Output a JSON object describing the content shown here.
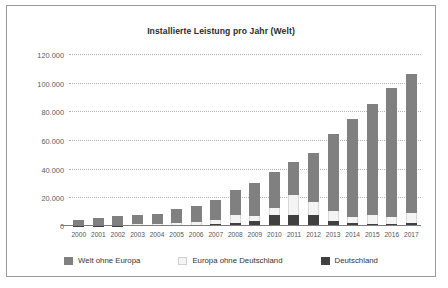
{
  "chart_data": {
    "type": "bar",
    "stacked": true,
    "title": "Installierte Leistung pro Jahr (Welt)",
    "xlabel": "",
    "ylabel": "",
    "ylim": [
      0,
      120000
    ],
    "ytick_values": [
      0,
      20000,
      40000,
      60000,
      80000,
      100000,
      120000
    ],
    "ytick_labels": [
      "0",
      "20.000",
      "40.000",
      "60.000",
      "80.000",
      "100.000",
      "120.000"
    ],
    "grid": true,
    "legend_position": "bottom",
    "categories": [
      "2000",
      "2001",
      "2002",
      "2003",
      "2004",
      "2005",
      "2006",
      "2007",
      "2008",
      "2009",
      "2010",
      "2011",
      "2012",
      "2013",
      "2014",
      "2015",
      "2016",
      "2017"
    ],
    "series": [
      {
        "name": "Deutschland",
        "color": "#404040",
        "values": [
          100,
          200,
          300,
          600,
          900,
          900,
          900,
          1100,
          1800,
          3800,
          7400,
          7500,
          7600,
          3300,
          1900,
          1500,
          1500,
          1800
        ]
      },
      {
        "name": "Europa ohne Deutschland",
        "color": "#f4f4f4",
        "values": [
          200,
          300,
          400,
          500,
          700,
          1500,
          1800,
          2900,
          5800,
          2900,
          5200,
          14000,
          9400,
          7200,
          4200,
          6000,
          4600,
          7200
        ]
      },
      {
        "name": "Welt ohne Europa",
        "color": "#808080",
        "values": [
          4000,
          5300,
          6300,
          6900,
          6800,
          9200,
          11100,
          14500,
          17400,
          23300,
          25400,
          23500,
          34000,
          53500,
          68900,
          77500,
          89900,
          97000
        ]
      }
    ],
    "totals": [
      4300,
      5800,
      7000,
      8000,
      8400,
      11600,
      13800,
      18500,
      25000,
      30000,
      38000,
      45000,
      51000,
      64000,
      75000,
      85000,
      96000,
      106000
    ]
  },
  "legend": {
    "items": [
      {
        "label": "Welt ohne Europa",
        "icon": "legend-swatch-world"
      },
      {
        "label": "Europa ohne Deutschland",
        "icon": "legend-swatch-europe"
      },
      {
        "label": "Deutschland",
        "icon": "legend-swatch-germany"
      }
    ]
  }
}
